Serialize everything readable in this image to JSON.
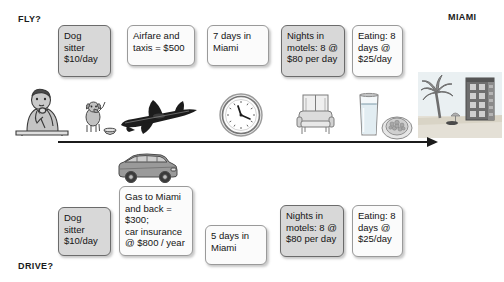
{
  "labels": {
    "fly": "FLY?",
    "drive": "DRIVE?",
    "destination": "MIAMI"
  },
  "fly_row": {
    "boxes": [
      {
        "id": "dog-sitter",
        "style": "grey",
        "text": "Dog sitter $10/day",
        "lines": [
          "Dog",
          "sitter",
          "$10/day"
        ]
      },
      {
        "id": "airfare",
        "style": "white",
        "text": "Airfare and taxis = $500",
        "lines": [
          "Airfare and",
          "taxis = $500"
        ]
      },
      {
        "id": "days-in-miami",
        "style": "white",
        "text": "7 days in Miami",
        "lines": [
          "7 days in",
          "Miami"
        ]
      },
      {
        "id": "motels",
        "style": "grey",
        "text": "Nights in motels: 8 @ $80 per day",
        "lines": [
          "Nights in",
          "motels: 8 @",
          "$80 per day"
        ]
      },
      {
        "id": "eating",
        "style": "white",
        "text": "Eating: 8 days @ $25/day",
        "lines": [
          "Eating: 8",
          "days @",
          "$25/day"
        ]
      }
    ],
    "icons": [
      {
        "name": "person-thinking-icon"
      },
      {
        "name": "dog-with-bowl-icon"
      },
      {
        "name": "airplane-icon"
      },
      {
        "name": "clock-icon"
      },
      {
        "name": "sofa-icon"
      },
      {
        "name": "glass-of-water-icon"
      },
      {
        "name": "food-plate-icon"
      },
      {
        "name": "miami-beach-building-icon"
      }
    ]
  },
  "drive_row": {
    "boxes": [
      {
        "id": "dog-sitter",
        "style": "grey",
        "text": "Dog sitter $10/day",
        "lines": [
          "Dog",
          "sitter",
          "$10/day"
        ]
      },
      {
        "id": "gas-insurance",
        "style": "white",
        "text": "Gas to Miami and back = $300; car insurance @ $800 / year",
        "lines": [
          "Gas to Miami",
          "and back =",
          "$300;",
          "car insurance",
          "@ $800 / year"
        ]
      },
      {
        "id": "days-in-miami",
        "style": "white",
        "text": "5 days in Miami",
        "lines": [
          "5 days in",
          "Miami"
        ]
      },
      {
        "id": "motels",
        "style": "grey",
        "text": "Nights in motels: 8 @ $80 per day",
        "lines": [
          "Nights in",
          "motels: 8 @",
          "$80 per day"
        ]
      },
      {
        "id": "eating",
        "style": "white",
        "text": "Eating: 8 days @ $25/day",
        "lines": [
          "Eating: 8",
          "days @",
          "$25/day"
        ]
      }
    ],
    "icons": [
      {
        "name": "suv-car-icon"
      }
    ]
  },
  "timeline": {
    "name": "timeline-arrow",
    "direction": "left-to-right"
  },
  "colors": {
    "box_grey_fill": "#d8d8d8",
    "box_grey_border": "#6b6b6b",
    "box_white_fill": "#fbfbfb",
    "box_white_border": "#9a9a9a",
    "text": "#141414",
    "arrow": "#1b1b1b"
  }
}
